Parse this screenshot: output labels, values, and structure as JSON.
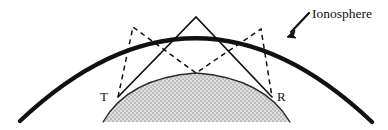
{
  "figure": {
    "background_color": "#ffffff",
    "width": 388,
    "height": 130
  },
  "labels": {
    "ionosphere": "Ionosphere",
    "transmitter": "T",
    "receiver": "R"
  },
  "colors": {
    "ionosphere_arc": "#111111",
    "earth_outline": "#2a2a2a",
    "earth_fill": "#c9c9c9",
    "ray_solid": "#111111",
    "ray_dashed": "#111111",
    "label_text": "#111111",
    "arrow": "#111111"
  },
  "geometry": {
    "ionosphere_arc": {
      "start": [
        20,
        121
      ],
      "control": [
        196,
        -45
      ],
      "end": [
        372,
        122
      ],
      "stroke_width": 4.2
    },
    "earth_dome": {
      "base_left": [
        103,
        122
      ],
      "apex": [
        196,
        73
      ],
      "base_right": [
        290,
        122
      ],
      "control_left": [
        128,
        78
      ],
      "control_right": [
        264,
        78
      ],
      "stroke_width": 1.3
    },
    "points": {
      "transmitter": [
        118,
        97
      ],
      "receiver": [
        272,
        97
      ],
      "ionosphere_apex": [
        196,
        17
      ],
      "ground_midpoint": [
        196,
        73
      ],
      "ionosphere_left_hop": [
        133,
        27
      ],
      "ionosphere_right_hop": [
        261,
        29
      ]
    },
    "rays": {
      "single_hop_solid": [
        [
          118,
          97,
          196,
          17
        ],
        [
          196,
          17,
          272,
          97
        ]
      ],
      "double_hop_dashed": [
        [
          118,
          97,
          133,
          27
        ],
        [
          133,
          27,
          196,
          73
        ],
        [
          196,
          73,
          261,
          29
        ],
        [
          261,
          29,
          272,
          97
        ]
      ],
      "dash_pattern": "5,4"
    },
    "arrow": {
      "tail": [
        309,
        13
      ],
      "head": [
        288,
        35
      ],
      "stroke_width": 2.2
    },
    "label_positions": {
      "ionosphere": [
        312,
        18
      ],
      "transmitter": [
        100,
        100
      ],
      "receiver": [
        277,
        100
      ]
    }
  }
}
